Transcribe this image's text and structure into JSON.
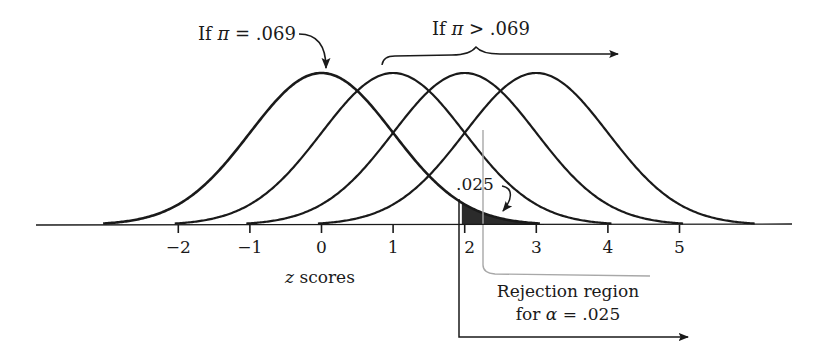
{
  "figure": {
    "type": "diagram",
    "colors": {
      "ink": "#1a1a1a",
      "shade": "#2b2b2b",
      "gray_line": "#a0a0a0",
      "background": "#ffffff"
    }
  },
  "annotations": {
    "null_label": "If π = .069",
    "null_label_prefix": "If ",
    "null_label_symbol": "π",
    "null_label_suffix": " = .069",
    "alt_label_prefix": "If ",
    "alt_label_symbol": "π",
    "alt_label_suffix": " > .069",
    "alt_label": "If π > .069",
    "tail_area": ".025",
    "rejection_line1": "Rejection region",
    "rejection_line2_prefix": "for ",
    "rejection_line2_symbol": "α",
    "rejection_line2_suffix": " = .025",
    "rejection_line2": "for α = .025"
  },
  "axis": {
    "label_var": "z",
    "label_rest": " scores",
    "label": "z scores",
    "ticks": [
      "−2",
      "−1",
      "0",
      "1",
      "2",
      "3",
      "4",
      "5"
    ],
    "tick_values": [
      -2,
      -1,
      0,
      1,
      2,
      3,
      4,
      5
    ]
  },
  "chart_data": {
    "type": "line",
    "title": "",
    "xlabel": "z scores",
    "ylabel": "",
    "xlim": [
      -3,
      6
    ],
    "series": [
      {
        "name": "If π = .069 (null)",
        "mean": 0,
        "sd": 1
      },
      {
        "name": "If π > .069 (alt 1)",
        "mean": 1,
        "sd": 1
      },
      {
        "name": "If π > .069 (alt 2)",
        "mean": 2,
        "sd": 1
      },
      {
        "name": "If π > .069 (alt 3)",
        "mean": 3,
        "sd": 1
      }
    ],
    "shaded_region": {
      "curve": "null",
      "from": 1.96,
      "to": 3.0,
      "area": 0.025
    },
    "critical_value": 1.96,
    "alpha": 0.025,
    "x_ticks": [
      -2,
      -1,
      0,
      1,
      2,
      3,
      4,
      5
    ]
  }
}
